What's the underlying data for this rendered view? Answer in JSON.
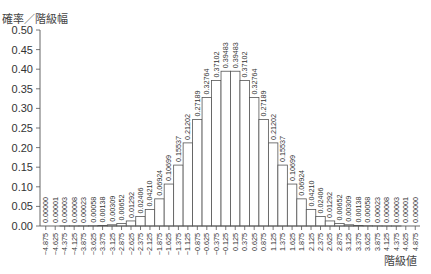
{
  "chart_data": {
    "type": "bar",
    "title": "",
    "xlabel": "階級値",
    "ylabel": "確率／階級幅",
    "ylim": [
      0,
      0.5
    ],
    "yticks": [
      "0.00",
      "0.05",
      "0.10",
      "0.15",
      "0.20",
      "0.25",
      "0.30",
      "0.35",
      "0.40",
      "0.45",
      "0.50"
    ],
    "grid": false,
    "categories": [
      "−4.875",
      "−4.625",
      "−4.375",
      "−4.125",
      "−3.875",
      "−3.625",
      "−3.375",
      "−3.125",
      "−2.875",
      "−2.625",
      "−2.375",
      "−2.125",
      "−1.875",
      "−1.625",
      "−1.375",
      "−1.125",
      "−0.875",
      "−0.625",
      "−0.375",
      "−0.125",
      "0.125",
      "0.375",
      "0.625",
      "0.875",
      "1.125",
      "1.375",
      "1.625",
      "1.875",
      "2.125",
      "2.375",
      "2.625",
      "2.875",
      "3.125",
      "3.375",
      "3.625",
      "3.875",
      "4.125",
      "4.375",
      "4.625",
      "4.875"
    ],
    "values": [
      0.0,
      1e-05,
      3e-05,
      8e-05,
      0.00023,
      0.00058,
      0.00138,
      0.00309,
      0.00652,
      0.01292,
      0.02406,
      0.0421,
      0.06924,
      0.10699,
      0.15537,
      0.21202,
      0.27189,
      0.32764,
      0.37102,
      0.39483,
      0.39483,
      0.37102,
      0.32764,
      0.27189,
      0.21202,
      0.15537,
      0.10699,
      0.06924,
      0.0421,
      0.02406,
      0.01292,
      0.00652,
      0.00309,
      0.00138,
      0.00058,
      0.00023,
      8e-05,
      3e-05,
      1e-05,
      0.0
    ],
    "data_labels": [
      "0.00000",
      "0.00001",
      "0.00003",
      "0.00008",
      "0.00023",
      "0.00058",
      "0.00138",
      "0.00309",
      "0.00652",
      "0.01292",
      "0.02406",
      "0.04210",
      "0.06924",
      "0.10699",
      "0.15537",
      "0.21202",
      "0.27189",
      "0.32764",
      "0.37102",
      "0.39483",
      "0.39483",
      "0.37102",
      "0.32764",
      "0.27189",
      "0.21202",
      "0.15537",
      "0.10699",
      "0.06924",
      "0.04210",
      "0.02406",
      "0.01292",
      "0.00652",
      "0.00309",
      "0.00138",
      "0.00058",
      "0.00023",
      "0.00008",
      "0.00003",
      "0.00001",
      "0.00000"
    ]
  }
}
